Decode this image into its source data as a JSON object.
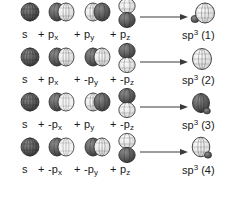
{
  "figure": {
    "colors": {
      "positive_lobe": "#4a4a4a",
      "negative_lobe": "#e8e8e8",
      "outline": "#2b2b2b",
      "arrow": "#3a3a3a",
      "text": "#1a1a1a",
      "background": "#ffffff"
    },
    "operators": {
      "plus": "+",
      "minus": "-"
    },
    "arrow_icon": "right-arrow-icon",
    "rows": [
      {
        "id": "row-1",
        "terms": [
          {
            "sign": "",
            "symbol": "s",
            "subscript": "",
            "orbital": "s-orbital"
          },
          {
            "sign": "",
            "symbol": "p",
            "subscript": "x",
            "orbital": "p-orbital-x"
          },
          {
            "sign": "",
            "symbol": "p",
            "subscript": "y",
            "orbital": "p-orbital-y"
          },
          {
            "sign": "",
            "symbol": "p",
            "subscript": "z",
            "orbital": "p-orbital-z"
          }
        ],
        "result": {
          "symbol": "sp",
          "superscript": "3",
          "index": "(1)",
          "orbital": "sp3-hybrid-orbital"
        }
      },
      {
        "id": "row-2",
        "terms": [
          {
            "sign": "",
            "symbol": "s",
            "subscript": "",
            "orbital": "s-orbital"
          },
          {
            "sign": "",
            "symbol": "p",
            "subscript": "x",
            "orbital": "p-orbital-x"
          },
          {
            "sign": "-",
            "symbol": "p",
            "subscript": "y",
            "orbital": "p-orbital-y-negative"
          },
          {
            "sign": "-",
            "symbol": "p",
            "subscript": "z",
            "orbital": "p-orbital-z-negative"
          }
        ],
        "result": {
          "symbol": "sp",
          "superscript": "3",
          "index": "(2)",
          "orbital": "sp3-hybrid-orbital"
        }
      },
      {
        "id": "row-3",
        "terms": [
          {
            "sign": "",
            "symbol": "s",
            "subscript": "",
            "orbital": "s-orbital"
          },
          {
            "sign": "-",
            "symbol": "p",
            "subscript": "x",
            "orbital": "p-orbital-x-negative"
          },
          {
            "sign": "",
            "symbol": "p",
            "subscript": "y",
            "orbital": "p-orbital-y"
          },
          {
            "sign": "-",
            "symbol": "p",
            "subscript": "z",
            "orbital": "p-orbital-z-negative"
          }
        ],
        "result": {
          "symbol": "sp",
          "superscript": "3",
          "index": "(3)",
          "orbital": "sp3-hybrid-orbital"
        }
      },
      {
        "id": "row-4",
        "terms": [
          {
            "sign": "",
            "symbol": "s",
            "subscript": "",
            "orbital": "s-orbital"
          },
          {
            "sign": "-",
            "symbol": "p",
            "subscript": "x",
            "orbital": "p-orbital-x-negative"
          },
          {
            "sign": "-",
            "symbol": "p",
            "subscript": "y",
            "orbital": "p-orbital-y-negative"
          },
          {
            "sign": "",
            "symbol": "p",
            "subscript": "z",
            "orbital": "p-orbital-z"
          }
        ],
        "result": {
          "symbol": "sp",
          "superscript": "3",
          "index": "(4)",
          "orbital": "sp3-hybrid-orbital"
        }
      }
    ]
  }
}
